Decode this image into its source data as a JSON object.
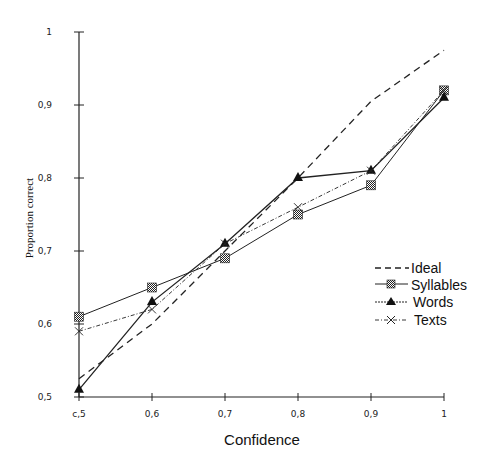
{
  "chart_data": {
    "type": "line",
    "title": "",
    "xlabel": "Confidence",
    "ylabel": "Proportion correct",
    "x": [
      0.5,
      0.6,
      0.7,
      0.8,
      0.9,
      1.0
    ],
    "xlim": [
      0.5,
      1.0
    ],
    "ylim": [
      0.5,
      1.0
    ],
    "x_tick_labels": [
      "c,5",
      "0,6",
      "0,7",
      "0,8",
      "0,9",
      "1"
    ],
    "y_tick_labels": [
      "0,5",
      "0,6",
      "0,7",
      "0,8",
      "0,9",
      "1"
    ],
    "grid": false,
    "legend_position": "right-middle",
    "series": [
      {
        "name": "Ideal",
        "style": "dashed",
        "marker": "none",
        "values": [
          0.525,
          0.6,
          0.7,
          0.8,
          0.905,
          0.975
        ]
      },
      {
        "name": "Syllables",
        "style": "solid",
        "marker": "checkered-square",
        "values": [
          0.61,
          0.65,
          0.69,
          0.75,
          0.79,
          0.92
        ]
      },
      {
        "name": "Words",
        "style": "solid",
        "marker": "triangle",
        "values": [
          0.51,
          0.63,
          0.71,
          0.8,
          0.81,
          0.91
        ]
      },
      {
        "name": "Texts",
        "style": "dash-dot",
        "marker": "x-cross",
        "values": [
          0.59,
          0.62,
          0.71,
          0.76,
          0.81,
          0.92
        ]
      }
    ]
  },
  "legend": {
    "items": [
      "Ideal",
      "Syllables",
      "Words",
      "Texts"
    ]
  },
  "axes": {
    "x_title": "Confidence",
    "y_title": "Proportion correct"
  }
}
